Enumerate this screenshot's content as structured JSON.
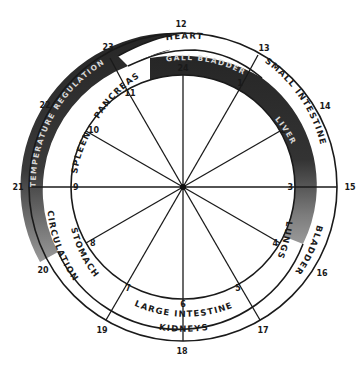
{
  "diagram": {
    "colors": {
      "ink": "#1a1a1a",
      "dark_band": "#2e2e2e",
      "dark_band_light": "#8a8a8a",
      "paper": "#ffffff"
    },
    "center": {
      "x": 183,
      "y": 187
    },
    "radii": {
      "inner": 112,
      "middle": 133,
      "outer": 154
    },
    "inner_hours": [
      {
        "label": "24",
        "hour": 0
      },
      {
        "label": "1",
        "hour": 1
      },
      {
        "label": "2",
        "hour": 2
      },
      {
        "label": "3",
        "hour": 3
      },
      {
        "label": "4",
        "hour": 4
      },
      {
        "label": "5",
        "hour": 5
      },
      {
        "label": "6",
        "hour": 6
      },
      {
        "label": "7",
        "hour": 7
      },
      {
        "label": "8",
        "hour": 8
      },
      {
        "label": "9",
        "hour": 9
      },
      {
        "label": "10",
        "hour": 10
      },
      {
        "label": "11",
        "hour": 11
      }
    ],
    "outer_hours": [
      {
        "label": "12",
        "hour": 0
      },
      {
        "label": "13",
        "hour": 1
      },
      {
        "label": "14",
        "hour": 2
      },
      {
        "label": "15",
        "hour": 3
      },
      {
        "label": "16",
        "hour": 4
      },
      {
        "label": "17",
        "hour": 5
      },
      {
        "label": "18",
        "hour": 6
      },
      {
        "label": "19",
        "hour": 7
      },
      {
        "label": "20",
        "hour": 8
      },
      {
        "label": "21",
        "hour": 9
      },
      {
        "label": "22",
        "hour": 10
      },
      {
        "label": "23",
        "hour": 11
      }
    ],
    "organs_outer_ring": [
      {
        "name": "HEART"
      },
      {
        "name": "SMALL INTESTINE"
      },
      {
        "name": "BLADDER"
      },
      {
        "name": "KIDNEYS"
      },
      {
        "name": "CIRCULATION"
      },
      {
        "name": "TEMPERATURE REGULATION"
      }
    ],
    "organs_inner_ring": [
      {
        "name": "GALL BLADDER"
      },
      {
        "name": "LIVER"
      },
      {
        "name": "LUNGS"
      },
      {
        "name": "LARGE INTESTINE"
      },
      {
        "name": "STOMACH"
      },
      {
        "name": "SPLEEN"
      },
      {
        "name": "PANCREAS"
      }
    ]
  }
}
